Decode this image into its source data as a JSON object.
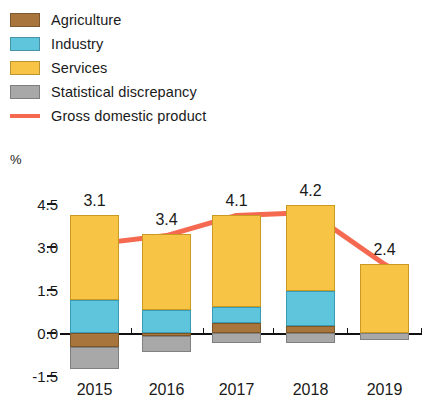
{
  "legend": {
    "items": [
      {
        "label": "Agriculture",
        "color": "#a8763c",
        "type": "swatch",
        "icon": "square-swatch-icon"
      },
      {
        "label": "Industry",
        "color": "#5fc5dd",
        "type": "swatch",
        "icon": "square-swatch-icon"
      },
      {
        "label": "Services",
        "color": "#f8c445",
        "type": "swatch",
        "icon": "square-swatch-icon"
      },
      {
        "label": "Statistical discrepancy",
        "color": "#a8a8a8",
        "type": "swatch",
        "icon": "square-swatch-icon"
      },
      {
        "label": "Gross domestic product",
        "color": "#f4694f",
        "type": "line",
        "icon": "line-swatch-icon"
      }
    ]
  },
  "axis": {
    "unit": "%",
    "yticks": [
      "4.5",
      "3.0",
      "1.5",
      "0.0",
      "-1.5"
    ],
    "ytick_values": [
      4.5,
      3.0,
      1.5,
      0.0,
      -1.5
    ]
  },
  "chart_data": {
    "type": "bar",
    "subtype": "stacked-bar-with-line-overlay",
    "title": "",
    "subtitle": "",
    "xlabel": "",
    "ylabel": "%",
    "ylim": [
      -1.5,
      4.5
    ],
    "ytick_step": 1.5,
    "grid": false,
    "legend_position": "top-left",
    "categories": [
      "2015",
      "2016",
      "2017",
      "2018",
      "2019"
    ],
    "series": [
      {
        "name": "Agriculture",
        "color": "#a8763c",
        "values": [
          -0.5,
          -0.1,
          0.35,
          0.25,
          0.0
        ]
      },
      {
        "name": "Industry",
        "color": "#5fc5dd",
        "values": [
          1.15,
          0.8,
          0.55,
          1.2,
          0.0
        ]
      },
      {
        "name": "Services",
        "color": "#f8c445",
        "values": [
          2.95,
          2.65,
          3.2,
          3.0,
          2.4
        ]
      },
      {
        "name": "Statistical discrepancy",
        "color": "#a8a8a8",
        "values": [
          -0.75,
          -0.55,
          -0.35,
          -0.35,
          -0.25
        ]
      }
    ],
    "line_series": {
      "name": "Gross domestic product",
      "color": "#f4694f",
      "values": [
        3.1,
        3.4,
        4.1,
        4.2,
        2.4
      ],
      "labels": [
        "3.1",
        "3.4",
        "4.1",
        "4.2",
        "2.4"
      ]
    }
  },
  "value_labels": [
    "3.1",
    "3.4",
    "4.1",
    "4.2",
    "2.4"
  ],
  "categories": [
    "2015",
    "2016",
    "2017",
    "2018",
    "2019"
  ]
}
